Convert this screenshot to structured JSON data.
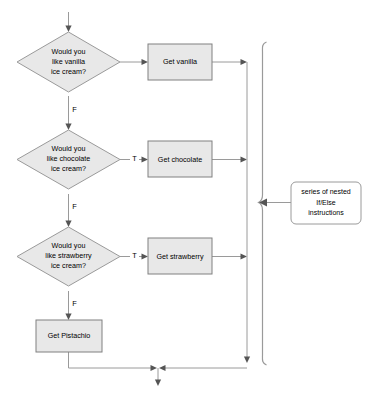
{
  "diagram": {
    "colors": {
      "node_fill": "#e8e8e8",
      "node_stroke": "#808080",
      "decision_stroke": "#9a9a9a",
      "note_fill": "#ffffff",
      "line": "#9a9a9a",
      "arrow": "#555555",
      "text": "#000000",
      "background": "#ffffff"
    },
    "decisions": [
      {
        "id": "d-vanilla",
        "lines": [
          "Would you",
          "like vanilla",
          "ice cream?"
        ],
        "true_label": "",
        "false_label": "F"
      },
      {
        "id": "d-chocolate",
        "lines": [
          "Would you",
          "like chocolate",
          "ice cream?"
        ],
        "true_label": "T",
        "false_label": "F"
      },
      {
        "id": "d-strawberry",
        "lines": [
          "Would you",
          "like strawberry",
          "ice cream?"
        ],
        "true_label": "T",
        "false_label": "F"
      }
    ],
    "processes": [
      {
        "id": "p-vanilla",
        "label": "Get vanilla"
      },
      {
        "id": "p-chocolate",
        "label": "Get chocolate"
      },
      {
        "id": "p-strawberry",
        "label": "Get strawberry"
      },
      {
        "id": "p-pistachio",
        "label": "Get Pistachio"
      }
    ],
    "annotation": {
      "id": "note-nested-ifelse",
      "lines": [
        "series of nested",
        "If/Else",
        "instructions"
      ]
    }
  }
}
